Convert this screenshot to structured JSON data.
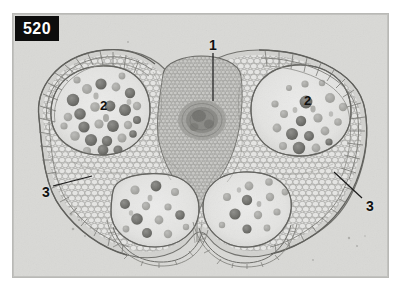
{
  "plate": {
    "figure_number": "520",
    "caption_visible": false,
    "background_color": "#ffffff",
    "photo_background_color": "#d9d9d6",
    "label_box_color": "#0d0d0d",
    "label_text_color": "#ffffff",
    "callout_color": "#111111"
  },
  "image": {
    "subject": "anther-cross-section-micrograph",
    "type": "light-micrograph",
    "stain_tone": "grayscale",
    "width": 375,
    "height": 263
  },
  "callouts": [
    {
      "id": "callout-1",
      "text": "1",
      "x": 209,
      "y": 38,
      "leader": true,
      "style": "outer"
    },
    {
      "id": "callout-2-left",
      "text": "2",
      "x": 100,
      "y": 99,
      "leader": false,
      "style": "inner"
    },
    {
      "id": "callout-2-right",
      "text": "2",
      "x": 304,
      "y": 94,
      "leader": false,
      "style": "inner"
    },
    {
      "id": "callout-3-left",
      "text": "3",
      "x": 42,
      "y": 185,
      "leader": true,
      "style": "outer"
    },
    {
      "id": "callout-3-right",
      "text": "3",
      "x": 366,
      "y": 199,
      "leader": true,
      "style": "outer"
    }
  ],
  "structures": {
    "connective": "central connective with vascular bundle",
    "locules": [
      "upper-left pollen sac",
      "upper-right pollen sac",
      "lower-left pollen sac",
      "lower-right pollen sac"
    ],
    "wall": "epidermis and endothecium cell layers"
  }
}
